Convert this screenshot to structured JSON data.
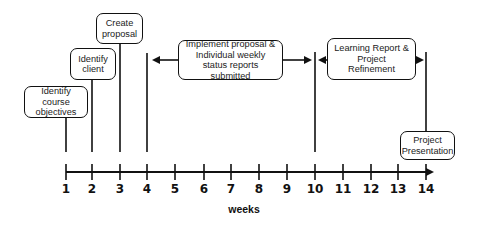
{
  "diagram": {
    "type": "timeline",
    "axis": {
      "label": "weeks",
      "ticks": [
        "1",
        "2",
        "3",
        "4",
        "5",
        "6",
        "7",
        "8",
        "9",
        "10",
        "11",
        "12",
        "13",
        "14"
      ]
    },
    "milestones": [
      {
        "id": "course-objectives",
        "week": 1,
        "label": "Identify course objectives"
      },
      {
        "id": "client",
        "week": 2,
        "label": "Identify client"
      },
      {
        "id": "proposal",
        "week": 3,
        "label": "Create proposal"
      },
      {
        "id": "presentation",
        "week": 14,
        "label": "Project Presentation"
      }
    ],
    "phases": [
      {
        "id": "implement",
        "start_week": 4,
        "end_week": 10,
        "label": "Implement proposal & Individual weekly status reports submitted"
      },
      {
        "id": "learning",
        "start_week": 10,
        "end_week": 14,
        "label": "Learning Report & Project Refinement"
      }
    ],
    "colors": {
      "line": "#111111",
      "text": "#222222",
      "background": "#ffffff"
    }
  }
}
